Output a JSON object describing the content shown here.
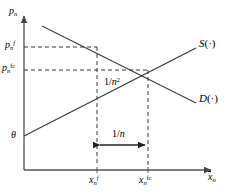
{
  "figure": {
    "type": "supply-demand-diagram",
    "background": "#ffffff",
    "line_color": "#3a3a3a",
    "axis_color": "#555555"
  },
  "axes": {
    "y_label_base": "p",
    "y_label_sub": "n",
    "x_label_base": "x",
    "x_label_sub": "n",
    "origin_px": [
      24,
      170
    ],
    "x_axis_end_px": [
      215,
      170
    ],
    "y_axis_top_px": [
      24,
      12
    ]
  },
  "y_ticks": [
    {
      "name": "price-flexible",
      "base": "p",
      "sub": "n",
      "sup": "f",
      "y_px": 47
    },
    {
      "name": "price-flexible-constrained",
      "base": "p",
      "sub": "n",
      "sup": "fc",
      "y_px": 70
    },
    {
      "name": "theta-intercept",
      "base": "θ",
      "sub": "",
      "sup": "",
      "y_px": 136
    }
  ],
  "x_ticks": [
    {
      "name": "quantity-flexible",
      "base": "x",
      "sub": "n",
      "sup": "f",
      "x_px": 97
    },
    {
      "name": "quantity-flexible-constrained",
      "base": "x",
      "sub": "n",
      "sup": "fc",
      "x_px": 148
    }
  ],
  "curves": [
    {
      "name": "supply-curve",
      "label_base": "S",
      "label_args": "(·)",
      "from_px": [
        24,
        136
      ],
      "to_px": [
        196,
        48
      ],
      "label_px": [
        199,
        38
      ]
    },
    {
      "name": "demand-curve",
      "label_base": "D",
      "label_args": "(·)",
      "from_px": [
        42,
        26
      ],
      "to_px": [
        196,
        103
      ],
      "label_px": [
        199,
        93
      ]
    }
  ],
  "intersection_px": [
    148,
    70
  ],
  "annotations": [
    {
      "name": "gap-one-over-n-squared",
      "text_base": "1/",
      "text_sub": "n",
      "text_sup": "2",
      "px": [
        104,
        77
      ]
    },
    {
      "name": "gap-one-over-n",
      "text_base": "1/",
      "text_sub": "n",
      "text_sup": "",
      "px": [
        112,
        129
      ]
    }
  ],
  "arrow": {
    "name": "one-over-n-span-arrow",
    "y_px": 145,
    "x_start_px": 97,
    "x_end_px": 148
  }
}
